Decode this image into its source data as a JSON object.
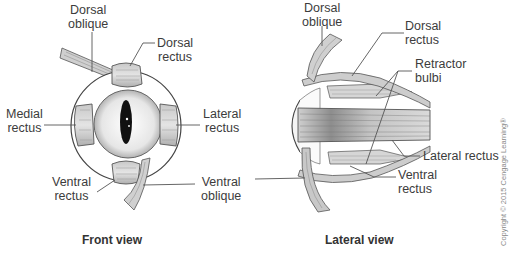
{
  "front_view": {
    "caption": "Front view",
    "labels": {
      "dorsal_oblique": [
        "Dorsal",
        "oblique"
      ],
      "dorsal_rectus": [
        "Dorsal",
        "rectus"
      ],
      "medial_rectus": [
        "Medial",
        "rectus"
      ],
      "lateral_rectus": [
        "Lateral",
        "rectus"
      ],
      "ventral_rectus": [
        "Ventral",
        "rectus"
      ],
      "ventral_oblique": [
        "Ventral",
        "oblique"
      ]
    }
  },
  "lateral_view": {
    "caption": "Lateral view",
    "labels": {
      "dorsal_oblique": [
        "Dorsal",
        "oblique"
      ],
      "dorsal_rectus": [
        "Dorsal",
        "rectus"
      ],
      "retractor_bulbi": [
        "Retractor",
        "bulbi"
      ],
      "lateral_rectus": "Lateral rectus",
      "ventral_rectus": [
        "Ventral",
        "rectus"
      ]
    }
  },
  "copyright": "Copyright © 2015 Cengage Learning®",
  "colors": {
    "line": "#555555",
    "muscle_fill": "#d4d4d4",
    "muscle_dark": "#9a9a9a",
    "eye_fill": "#eeeeee",
    "pupil": "#111111"
  }
}
